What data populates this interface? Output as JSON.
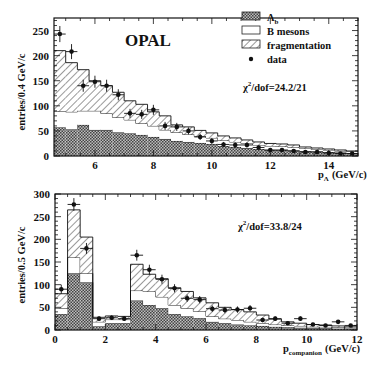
{
  "chart_data": [
    {
      "type": "bar",
      "title": "OPAL",
      "xlabel": "p_Λ (GeV/c)",
      "xlabel_main": "p",
      "xlabel_sub": "Λ",
      "xlabel_unit": "(GeV/c)",
      "ylabel": "entries/0.4 GeV/c",
      "xlim": [
        4.6,
        15.0
      ],
      "ylim": [
        0,
        275
      ],
      "xticks": [
        6,
        8,
        10,
        12,
        14
      ],
      "yticks": [
        0,
        50,
        100,
        150,
        200,
        250
      ],
      "bin_edges": [
        4.6,
        5.0,
        5.4,
        5.8,
        6.2,
        6.6,
        7.0,
        7.4,
        7.8,
        8.2,
        8.6,
        9.0,
        9.4,
        9.8,
        10.2,
        10.6,
        11.0,
        11.4,
        11.8,
        12.2,
        12.6,
        13.0,
        13.4,
        13.8,
        14.2,
        14.6,
        15.0
      ],
      "stack_series": [
        {
          "name": "Λb",
          "pattern": "crosshatch",
          "values": [
            57,
            53,
            62,
            52,
            52,
            47,
            45,
            42,
            38,
            34,
            30,
            28,
            26,
            24,
            20,
            18,
            16,
            14,
            12,
            12,
            11,
            10,
            9,
            8,
            7,
            6
          ]
        },
        {
          "name": "B mesons",
          "pattern": "open",
          "values": [
            32,
            35,
            28,
            38,
            33,
            30,
            27,
            23,
            22,
            18,
            17,
            15,
            13,
            12,
            11,
            10,
            9,
            8,
            8,
            7,
            6,
            5,
            4,
            4,
            3,
            3
          ]
        },
        {
          "name": "fragmentation",
          "pattern": "hatch",
          "values": [
            121,
            98,
            82,
            60,
            55,
            50,
            38,
            38,
            28,
            28,
            15,
            15,
            12,
            10,
            9,
            8,
            7,
            6,
            5,
            5,
            5,
            3,
            3,
            2,
            2,
            1
          ]
        }
      ],
      "data_points": {
        "name": "data",
        "x": [
          4.8,
          5.2,
          5.6,
          6.0,
          6.4,
          6.8,
          7.2,
          7.6,
          8.0,
          8.4,
          8.8,
          9.2,
          9.6,
          10.0,
          10.4,
          10.8,
          11.2,
          11.6,
          12.0,
          12.4,
          12.8,
          13.2,
          13.6,
          14.0,
          14.4,
          14.8
        ],
        "y": [
          243,
          208,
          140,
          148,
          140,
          122,
          85,
          83,
          92,
          60,
          58,
          50,
          38,
          30,
          23,
          22,
          22,
          17,
          12,
          12,
          10,
          8,
          8,
          6,
          5,
          5
        ],
        "yerr": [
          16,
          15,
          12,
          12,
          12,
          11,
          9,
          9,
          10,
          8,
          8,
          7,
          6,
          6,
          5,
          5,
          5,
          4,
          4,
          4,
          3,
          3,
          3,
          3,
          2,
          2
        ]
      },
      "legend": [
        {
          "label": "Λb",
          "label_main": "Λ",
          "label_sub": "b",
          "pattern": "crosshatch"
        },
        {
          "label": "B mesons",
          "pattern": "open"
        },
        {
          "label": "fragmentation",
          "pattern": "hatch"
        },
        {
          "label": "data",
          "pattern": "marker"
        }
      ],
      "annotation": "χ²/dof=24.2/21",
      "annotation_rest": "/dof=24.2/21"
    },
    {
      "type": "bar",
      "xlabel": "p_companion (GeV/c)",
      "xlabel_main": "p",
      "xlabel_sub": "companion",
      "xlabel_unit": "(GeV/c)",
      "ylabel": "entries/0.5 GeV/c",
      "xlim": [
        0,
        12
      ],
      "ylim": [
        0,
        300
      ],
      "xticks": [
        0,
        2,
        4,
        6,
        8,
        10,
        12
      ],
      "yticks": [
        0,
        50,
        100,
        150,
        200,
        250,
        300
      ],
      "bin_edges": [
        0,
        0.5,
        1.0,
        1.5,
        2.0,
        2.5,
        3.0,
        3.5,
        4.0,
        4.5,
        5.0,
        5.5,
        6.0,
        6.5,
        7.0,
        7.5,
        8.0,
        8.5,
        9.0,
        9.5,
        10.0,
        10.5,
        11.0,
        11.5,
        12.0
      ],
      "stack_series": [
        {
          "name": "Λb",
          "pattern": "crosshatch",
          "values": [
            35,
            125,
            105,
            8,
            15,
            15,
            65,
            55,
            48,
            35,
            30,
            26,
            18,
            15,
            12,
            10,
            9,
            7,
            6,
            5,
            4,
            4,
            3,
            3
          ]
        },
        {
          "name": "B mesons",
          "pattern": "open",
          "values": [
            13,
            35,
            20,
            10,
            8,
            8,
            22,
            30,
            25,
            20,
            18,
            15,
            12,
            10,
            10,
            8,
            6,
            5,
            4,
            4,
            3,
            3,
            3,
            2
          ]
        },
        {
          "name": "fragmentation",
          "pattern": "hatch",
          "values": [
            32,
            105,
            80,
            10,
            8,
            7,
            58,
            38,
            40,
            38,
            37,
            30,
            30,
            25,
            23,
            22,
            18,
            12,
            8,
            6,
            5,
            4,
            3,
            2
          ]
        }
      ],
      "data_points": {
        "name": "data",
        "x": [
          0.25,
          0.75,
          1.25,
          1.75,
          2.25,
          2.75,
          3.25,
          3.75,
          4.25,
          4.75,
          5.25,
          5.75,
          6.25,
          6.75,
          7.25,
          7.75,
          8.25,
          8.75,
          9.25,
          9.75,
          10.25,
          10.75,
          11.25,
          11.75
        ],
        "y": [
          90,
          277,
          180,
          25,
          27,
          25,
          165,
          133,
          112,
          92,
          70,
          67,
          47,
          44,
          45,
          48,
          22,
          25,
          15,
          25,
          12,
          10,
          18,
          10
        ],
        "yerr": [
          10,
          14,
          12,
          5,
          5,
          5,
          12,
          11,
          10,
          9,
          8,
          8,
          7,
          7,
          7,
          7,
          5,
          5,
          4,
          5,
          4,
          3,
          4,
          3
        ]
      },
      "annotation": "χ²/dof=33.8/24",
      "annotation_rest": "/dof=33.8/24"
    }
  ]
}
